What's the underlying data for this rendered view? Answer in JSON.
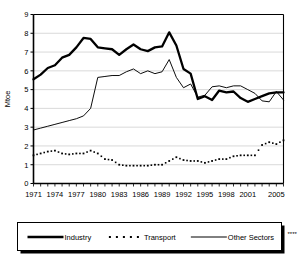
{
  "chart_data": {
    "type": "line",
    "title": "",
    "xlabel": "",
    "ylabel": "Mtoe",
    "ylim": [
      0,
      9
    ],
    "xlim": [
      1971,
      2006
    ],
    "grid": true,
    "y_ticks": [
      "0",
      "1",
      "2",
      "3",
      "4",
      "5",
      "6",
      "7",
      "8",
      "9"
    ],
    "x_ticks": [
      "1971",
      "1974",
      "1977",
      "1980",
      "1983",
      "1986",
      "1989",
      "1992",
      "1995",
      "1998",
      "2001",
      "2005"
    ],
    "x_tick_years": [
      1971,
      1974,
      1977,
      1980,
      1983,
      1986,
      1989,
      1992,
      1995,
      1998,
      2001,
      2005
    ],
    "x": [
      1971,
      1972,
      1973,
      1974,
      1975,
      1976,
      1977,
      1978,
      1979,
      1980,
      1981,
      1982,
      1983,
      1984,
      1985,
      1986,
      1987,
      1988,
      1989,
      1990,
      1991,
      1992,
      1993,
      1994,
      1995,
      1996,
      1997,
      1998,
      1999,
      2000,
      2001,
      2002,
      2003,
      2004,
      2005,
      2006
    ],
    "legend_position": "bottom",
    "series": [
      {
        "name": "Industry",
        "style": "thick-solid",
        "color": "#000000",
        "values": [
          5.55,
          5.8,
          6.15,
          6.3,
          6.7,
          6.85,
          7.25,
          7.75,
          7.7,
          7.25,
          7.2,
          7.15,
          6.85,
          7.15,
          7.4,
          7.15,
          7.05,
          7.25,
          7.3,
          8.05,
          7.35,
          6.1,
          5.85,
          4.5,
          4.65,
          4.45,
          4.95,
          4.85,
          4.9,
          4.55,
          4.35,
          4.5,
          4.65,
          4.8,
          4.85,
          4.85
        ]
      },
      {
        "name": "Transport",
        "style": "dotted",
        "color": "#000000",
        "values": [
          1.5,
          1.6,
          1.7,
          1.75,
          1.6,
          1.55,
          1.6,
          1.6,
          1.75,
          1.6,
          1.3,
          1.25,
          1.0,
          0.95,
          0.95,
          0.95,
          0.95,
          1.0,
          1.0,
          1.2,
          1.4,
          1.25,
          1.2,
          1.2,
          1.1,
          1.2,
          1.3,
          1.3,
          1.45,
          1.5,
          1.5,
          1.5,
          2.05,
          2.2,
          2.1,
          2.3
        ]
      },
      {
        "name": "Other Sectors",
        "name_suffix": "****",
        "style": "thin-solid",
        "color": "#000000",
        "values": [
          2.85,
          2.95,
          3.05,
          3.15,
          3.25,
          3.35,
          3.45,
          3.6,
          4.0,
          5.65,
          5.7,
          5.75,
          5.75,
          5.95,
          6.1,
          5.85,
          6.0,
          5.85,
          5.95,
          6.6,
          5.65,
          5.1,
          5.3,
          4.6,
          4.7,
          5.15,
          5.2,
          5.1,
          5.2,
          5.2,
          5.0,
          4.8,
          4.4,
          4.35,
          4.9,
          4.45
        ]
      }
    ]
  },
  "legend": {
    "items": [
      {
        "label": "Industry",
        "suffix": ""
      },
      {
        "label": "Transport",
        "suffix": ""
      },
      {
        "label": "Other Sectors",
        "suffix": "****"
      }
    ]
  }
}
